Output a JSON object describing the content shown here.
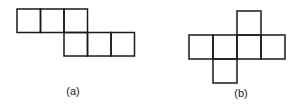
{
  "figures": [
    {
      "id": "a",
      "label": "(a)",
      "cell_size": 23.5,
      "squares": [
        {
          "col": 0,
          "row": 0
        },
        {
          "col": 1,
          "row": 0
        },
        {
          "col": 2,
          "row": 0
        },
        {
          "col": 2,
          "row": 1
        },
        {
          "col": 3,
          "row": 1
        },
        {
          "col": 4,
          "row": 1
        }
      ],
      "origin": [
        17,
        9
      ],
      "label_pos": [
        73,
        95
      ]
    },
    {
      "id": "b",
      "label": "(b)",
      "cell_size": 24,
      "squares": [
        {
          "col": 2,
          "row": 0
        },
        {
          "col": 0,
          "row": 1
        },
        {
          "col": 1,
          "row": 1
        },
        {
          "col": 2,
          "row": 1
        },
        {
          "col": 3,
          "row": 1
        },
        {
          "col": 1,
          "row": 2
        }
      ],
      "origin": [
        189,
        11
      ],
      "label_pos": [
        241,
        97
      ]
    }
  ]
}
